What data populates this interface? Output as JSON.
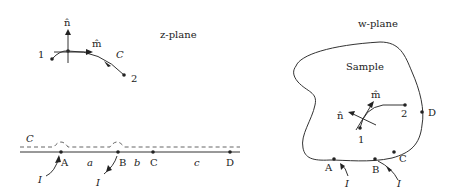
{
  "zplane": {
    "title": "z-plane",
    "curve_label": "C",
    "normal_label": "n̂",
    "tangent_label": "m̂",
    "start_label": "1",
    "end_label": "2"
  },
  "line": {
    "contour_label": "C",
    "points": [
      "A",
      "B",
      "C",
      "D"
    ],
    "segments": [
      "a",
      "b",
      "c"
    ],
    "current_label_1": "I",
    "current_label_2": "I"
  },
  "wplane": {
    "title": "w-plane",
    "region_label": "Sample",
    "normal_label": "n̂",
    "tangent_label": "m̂",
    "start_label": "1",
    "end_label": "2",
    "points": [
      "A",
      "B",
      "C",
      "D"
    ],
    "current_label_1": "I",
    "current_label_2": "I"
  }
}
